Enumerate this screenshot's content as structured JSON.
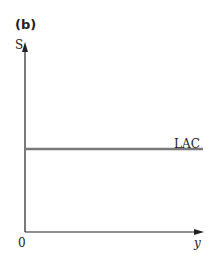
{
  "panel_label": "(b)",
  "y_axis_label": "S",
  "x_axis_label": "y",
  "origin_label": "0",
  "curves": [
    {
      "name": "LAC",
      "label": "LAC",
      "shape": "horizontal line",
      "color": "#7a7a7a"
    }
  ],
  "axis_color": "#222222"
}
